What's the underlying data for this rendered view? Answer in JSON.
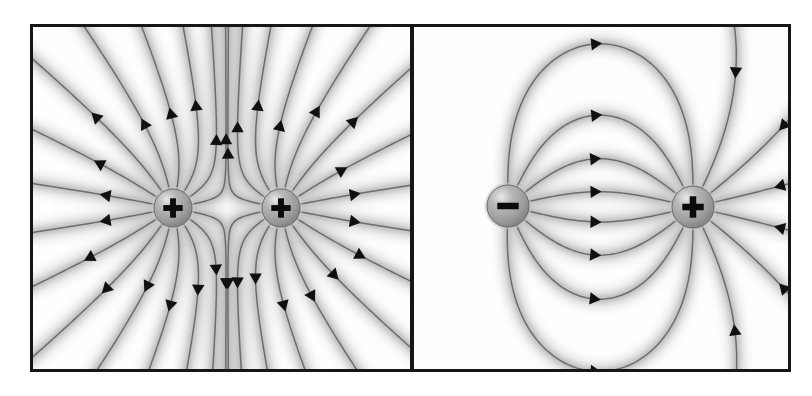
{
  "figure": {
    "background_color": "#ffffff",
    "border_color": "#161616",
    "field_line_color": "#6d6d6d",
    "arrow_color": "#101010",
    "glow_color": "#b4b4b4",
    "sphere_fill": "#9a9a9a",
    "sphere_edge": "#6a6a6a",
    "sphere_highlight": "#e8e8e8",
    "width": 812,
    "height": 396
  },
  "panels": [
    {
      "id": "panel-a",
      "name": "like-charges-panel",
      "description": "Two equal positive point charges; field lines radiate outward from each and repel, forming a neutral saddle point midway between them.",
      "x": 30,
      "y": 24,
      "width": 383,
      "height": 348,
      "charges": [
        {
          "name": "positive-charge-left",
          "sign": "+",
          "symbol": "+",
          "cx": 140,
          "cy": 181,
          "r": 19,
          "polarity": "positive"
        },
        {
          "name": "positive-charge-right",
          "sign": "+",
          "symbol": "+",
          "cx": 248,
          "cy": 181,
          "r": 19,
          "polarity": "positive"
        }
      ],
      "field": {
        "type": "like-charges",
        "lines_per_charge": 16,
        "direction": "outward",
        "neutral_point": {
          "x": 194,
          "y": 181,
          "label": "saddle point"
        }
      }
    },
    {
      "id": "panel-b",
      "name": "dipole-panel",
      "description": "Equal and opposite point charges forming an electric dipole; field lines leave the positive charge and terminate on the negative charge.",
      "x": 411,
      "y": 24,
      "width": 380,
      "height": 348,
      "charges": [
        {
          "name": "negative-charge",
          "sign": "-",
          "symbol": "–",
          "cx": 94,
          "cy": 179,
          "r": 21,
          "polarity": "negative"
        },
        {
          "name": "positive-charge",
          "sign": "+",
          "symbol": "+",
          "cx": 279,
          "cy": 180,
          "r": 21,
          "polarity": "positive"
        }
      ],
      "field": {
        "type": "dipole",
        "lines_per_charge": 14,
        "direction": "from-positive-to-negative",
        "inner_arc_count": 7
      }
    }
  ],
  "symbols": {
    "plus": "+",
    "minus": "–",
    "arrowhead": "triangle"
  }
}
